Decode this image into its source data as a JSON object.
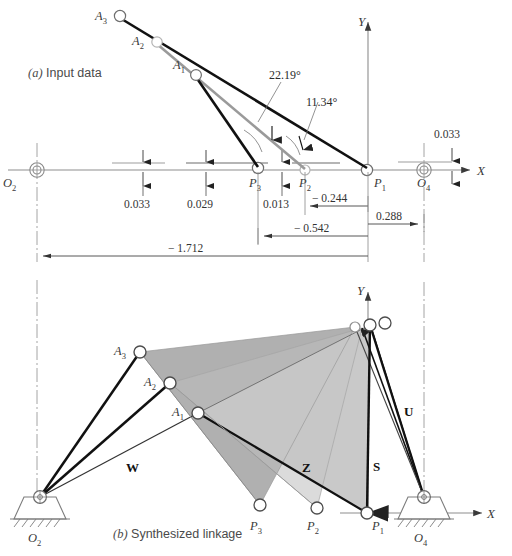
{
  "figure": {
    "panels": [
      {
        "id": "a",
        "caption_prefix": "(a)",
        "caption": "Input data"
      },
      {
        "id": "b",
        "caption_prefix": "(b)",
        "caption": "Synthesized linkage"
      }
    ]
  },
  "axes": {
    "x_label": "X",
    "y_label": "Y"
  },
  "panel_a": {
    "caption_prefix": "(a)",
    "caption_text": "Input data",
    "points": [
      {
        "name": "O2",
        "base": "O",
        "sub": "2"
      },
      {
        "name": "O4",
        "base": "O",
        "sub": "4"
      },
      {
        "name": "P1",
        "base": "P",
        "sub": "1"
      },
      {
        "name": "P2",
        "base": "P",
        "sub": "2"
      },
      {
        "name": "P3",
        "base": "P",
        "sub": "3"
      },
      {
        "name": "A1",
        "base": "A",
        "sub": "1"
      },
      {
        "name": "A2",
        "base": "A",
        "sub": "2"
      },
      {
        "name": "A3",
        "base": "A",
        "sub": "3"
      }
    ],
    "angles": [
      {
        "id": "alpha2",
        "value": "22.19°"
      },
      {
        "id": "alpha3",
        "value": "11.34°"
      }
    ],
    "vertical_offsets": [
      {
        "id": "off-O2",
        "value": "0.033"
      },
      {
        "id": "off-mid",
        "value": "0.029"
      },
      {
        "id": "off-P2",
        "value": "0.013"
      },
      {
        "id": "off-O4",
        "value": "0.033"
      }
    ],
    "horizontal_dims": [
      {
        "id": "dim-P2",
        "value": "− 0.244"
      },
      {
        "id": "dim-O4",
        "value": "0.288"
      },
      {
        "id": "dim-P3",
        "value": "− 0.542"
      },
      {
        "id": "dim-O2",
        "value": "− 1.712"
      }
    ]
  },
  "panel_b": {
    "caption_prefix": "(b)",
    "caption_text": "Synthesized linkage",
    "points": [
      {
        "name": "O2",
        "base": "O",
        "sub": "2"
      },
      {
        "name": "O4",
        "base": "O",
        "sub": "4"
      },
      {
        "name": "P1",
        "base": "P",
        "sub": "1"
      },
      {
        "name": "P2",
        "base": "P",
        "sub": "2"
      },
      {
        "name": "P3",
        "base": "P",
        "sub": "3"
      },
      {
        "name": "A1",
        "base": "A",
        "sub": "1"
      },
      {
        "name": "A2",
        "base": "A",
        "sub": "2"
      },
      {
        "name": "A3",
        "base": "A",
        "sub": "3"
      }
    ],
    "vectors": [
      {
        "id": "W",
        "label": "W"
      },
      {
        "id": "Z",
        "label": "Z"
      },
      {
        "id": "S",
        "label": "S"
      },
      {
        "id": "U",
        "label": "U"
      }
    ]
  },
  "colors": {
    "link_dark": "#111111",
    "link_gray": "#9a9a9a",
    "axis": "#8d8d8d",
    "coupler_light": "#c9c9c9",
    "coupler_mid": "#b0b0b0",
    "coupler_dark": "#9d9d9d",
    "dim_line": "#6b6b6b",
    "background": "#ffffff"
  }
}
